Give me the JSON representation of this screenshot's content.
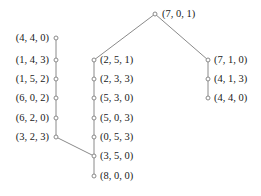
{
  "figure": {
    "type": "tree-diagram",
    "width": 261,
    "height": 196,
    "background_color": "#ffffff",
    "node_stroke_color": "#8a8a8a",
    "node_fill_color": "#ffffff",
    "edge_color": "#8a8a8a",
    "text_color": "#1a1a1a"
  },
  "nodes": [
    {
      "id": "root",
      "label": "(7, 0, 1)",
      "x": 155,
      "y": 14,
      "label_side": "right",
      "label_dx": 7,
      "label_dy": 0
    },
    {
      "id": "L1",
      "label": "(4, 4, 0)",
      "x": 56,
      "y": 38,
      "label_side": "left",
      "label_dx": -7,
      "label_dy": 0
    },
    {
      "id": "L2",
      "label": "(1, 4, 3)",
      "x": 56,
      "y": 60,
      "label_side": "left",
      "label_dx": -7,
      "label_dy": 0
    },
    {
      "id": "L3",
      "label": "(1, 5, 2)",
      "x": 56,
      "y": 79,
      "label_side": "left",
      "label_dx": -7,
      "label_dy": 0
    },
    {
      "id": "L4",
      "label": "(6, 0, 2)",
      "x": 56,
      "y": 98,
      "label_side": "left",
      "label_dx": -7,
      "label_dy": 0
    },
    {
      "id": "L5",
      "label": "(6, 2, 0)",
      "x": 56,
      "y": 118,
      "label_side": "left",
      "label_dx": -7,
      "label_dy": 0
    },
    {
      "id": "L6",
      "label": "(3, 2, 3)",
      "x": 56,
      "y": 137,
      "label_side": "left",
      "label_dx": -7,
      "label_dy": 0
    },
    {
      "id": "M1",
      "label": "(2, 5, 1)",
      "x": 94,
      "y": 60,
      "label_side": "right",
      "label_dx": 6,
      "label_dy": 0
    },
    {
      "id": "M2",
      "label": "(2, 3, 3)",
      "x": 94,
      "y": 79,
      "label_side": "right",
      "label_dx": 6,
      "label_dy": 0
    },
    {
      "id": "M3",
      "label": "(5, 3, 0)",
      "x": 94,
      "y": 98,
      "label_side": "right",
      "label_dx": 6,
      "label_dy": 0
    },
    {
      "id": "M4",
      "label": "(5, 0, 3)",
      "x": 94,
      "y": 118,
      "label_side": "right",
      "label_dx": 6,
      "label_dy": 0
    },
    {
      "id": "M5",
      "label": "(0, 5, 3)",
      "x": 94,
      "y": 137,
      "label_side": "right",
      "label_dx": 6,
      "label_dy": 0
    },
    {
      "id": "M6",
      "label": "(3, 5, 0)",
      "x": 94,
      "y": 156,
      "label_side": "right",
      "label_dx": 6,
      "label_dy": 0
    },
    {
      "id": "M7",
      "label": "(8, 0, 0)",
      "x": 94,
      "y": 176,
      "label_side": "right",
      "label_dx": 6,
      "label_dy": 0
    },
    {
      "id": "R1",
      "label": "(7, 1, 0)",
      "x": 208,
      "y": 60,
      "label_side": "right",
      "label_dx": 6,
      "label_dy": 0
    },
    {
      "id": "R2",
      "label": "(4, 1, 3)",
      "x": 208,
      "y": 79,
      "label_side": "right",
      "label_dx": 6,
      "label_dy": 0
    },
    {
      "id": "R3",
      "label": "(4, 4, 0)",
      "x": 208,
      "y": 98,
      "label_side": "right",
      "label_dx": 6,
      "label_dy": 0
    }
  ],
  "edges": [
    {
      "from": "root",
      "to": "M1"
    },
    {
      "from": "root",
      "to": "R1"
    },
    {
      "from": "L1",
      "to": "L2"
    },
    {
      "from": "L2",
      "to": "L3"
    },
    {
      "from": "L3",
      "to": "L4"
    },
    {
      "from": "L4",
      "to": "L5"
    },
    {
      "from": "L5",
      "to": "L6"
    },
    {
      "from": "L6",
      "to": "M6"
    },
    {
      "from": "M1",
      "to": "M2"
    },
    {
      "from": "M2",
      "to": "M3"
    },
    {
      "from": "M3",
      "to": "M4"
    },
    {
      "from": "M4",
      "to": "M5"
    },
    {
      "from": "M5",
      "to": "M6"
    },
    {
      "from": "M6",
      "to": "M7"
    },
    {
      "from": "R1",
      "to": "R2"
    },
    {
      "from": "R2",
      "to": "R3"
    }
  ]
}
